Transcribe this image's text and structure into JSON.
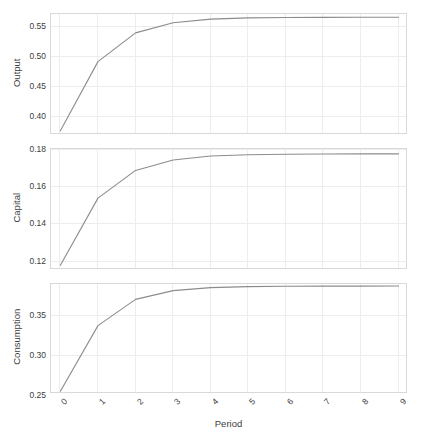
{
  "chart_data": {
    "type": "line",
    "title": "",
    "subtitle": "",
    "xlabel": "Period",
    "ylabel": "",
    "grid": true,
    "legend": false,
    "legend_position": "none",
    "layout": "faceted-vertical-3-panels-shared-x",
    "line_color": "#8c8c8c",
    "grid_color": "#ededed",
    "panel_border_color": "#d9d9d9",
    "x": [
      0,
      1,
      2,
      3,
      4,
      5,
      6,
      7,
      8,
      9
    ],
    "xlim": [
      -0.25,
      9.25
    ],
    "x_tick_labels": [
      "0",
      "1",
      "2",
      "3",
      "4",
      "5",
      "6",
      "7",
      "8",
      "9"
    ],
    "x_tick_rotation_deg": -45,
    "panels": [
      {
        "ylabel": "Output",
        "ylim": [
          0.37,
          0.572
        ],
        "y_ticks": [
          0.4,
          0.45,
          0.5,
          0.55
        ],
        "y_tick_labels": [
          "0.40",
          "0.45",
          "0.50",
          "0.55"
        ],
        "values": [
          0.377,
          0.4925,
          0.5405,
          0.5575,
          0.5635,
          0.5655,
          0.5662,
          0.5664,
          0.5665,
          0.5665
        ]
      },
      {
        "ylabel": "Capital",
        "ylim": [
          0.1155,
          0.1805
        ],
        "y_ticks": [
          0.12,
          0.14,
          0.16,
          0.18
        ],
        "y_tick_labels": [
          "0.12",
          "0.14",
          "0.16",
          "0.18"
        ],
        "values": [
          0.118,
          0.1541,
          0.169,
          0.1746,
          0.1767,
          0.1774,
          0.1777,
          0.1778,
          0.1779,
          0.1779
        ]
      },
      {
        "ylabel": "Consumption",
        "ylim": [
          0.2525,
          0.3905
        ],
        "y_ticks": [
          0.25,
          0.3,
          0.35
        ],
        "y_tick_labels": [
          "0.25",
          "0.30",
          "0.35"
        ],
        "values": [
          0.256,
          0.3383,
          0.3712,
          0.3822,
          0.386,
          0.3872,
          0.3876,
          0.3878,
          0.3878,
          0.3879
        ]
      }
    ]
  },
  "axes": {
    "x_title": "Period"
  }
}
